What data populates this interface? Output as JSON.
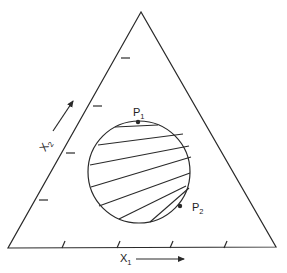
{
  "diagram": {
    "type": "ternary-triangle",
    "stroke_color": "#2a2a2a",
    "background": "#ffffff",
    "triangle": {
      "apex": [
        141,
        12
      ],
      "bottom_left": [
        8,
        248
      ],
      "bottom_right": [
        276,
        247
      ]
    },
    "bottom_ticks_x": [
      62,
      117,
      170,
      224
    ],
    "left_ticks": [
      [
        122,
        58
      ],
      [
        94,
        106
      ],
      [
        67,
        153
      ],
      [
        40,
        200
      ]
    ],
    "circle": {
      "cx": 139,
      "cy": 172,
      "r": 51
    },
    "chords": [
      [
        [
          115,
          127
        ],
        [
          158,
          125
        ]
      ],
      [
        [
          98,
          145
        ],
        [
          183,
          134
        ]
      ],
      [
        [
          90,
          165
        ],
        [
          189,
          146
        ]
      ],
      [
        [
          91,
          187
        ],
        [
          191,
          157
        ]
      ],
      [
        [
          99,
          206
        ],
        [
          190,
          173
        ]
      ],
      [
        [
          119,
          219
        ],
        [
          186,
          186
        ]
      ],
      [
        [
          150,
          222
        ],
        [
          189,
          188
        ]
      ]
    ],
    "points": [
      {
        "id": "P1",
        "label": "P",
        "subscript": "1",
        "x": 138,
        "y": 122
      },
      {
        "id": "P2",
        "label": "P",
        "subscript": "2",
        "x": 180,
        "y": 206
      }
    ],
    "axes": {
      "x1": {
        "label": "X",
        "subscript": "1"
      },
      "x2": {
        "label": "X",
        "subscript": "2"
      }
    }
  }
}
